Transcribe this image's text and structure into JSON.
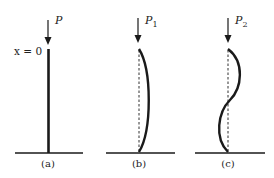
{
  "figure": {
    "panels": [
      {
        "id": "a",
        "caption": "(a)",
        "load_label": "P",
        "load_subscript": "",
        "origin_label": "x = 0",
        "shape": "straight"
      },
      {
        "id": "b",
        "caption": "(b)",
        "load_label": "P",
        "load_subscript": "1",
        "shape": "first buckling mode (half sine)"
      },
      {
        "id": "c",
        "caption": "(c)",
        "load_label": "P",
        "load_subscript": "2",
        "shape": "second buckling mode (full sine)"
      }
    ],
    "colors": {
      "line": "#1a1a1a",
      "background": "#ffffff"
    }
  }
}
